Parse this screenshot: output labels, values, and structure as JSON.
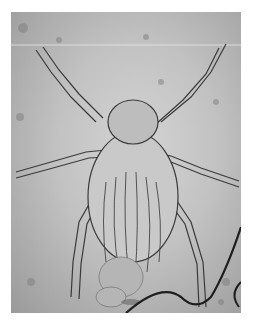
{
  "image": {
    "subject": "microscope image of a mite",
    "description": "Grayscale light micrograph of a mite with eight jointed legs, setae on body, debris and a dark fiber in lower right",
    "colors": {
      "background": "#ffffff",
      "field_light": "#d4d4d4",
      "field_dark": "#9a9a9a",
      "outline": "#3a3a3a",
      "fiber": "#1e1e1e"
    }
  }
}
